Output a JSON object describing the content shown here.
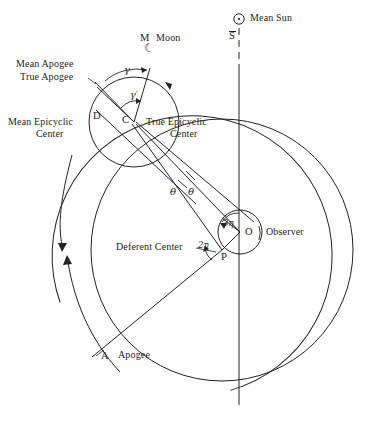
{
  "figure": {
    "stroke_color": "#232323",
    "background": "#ffffff"
  },
  "labels": {
    "mean_sun": "Mean Sun",
    "mean_sun_icon": "sun-symbol-circle-dot",
    "s_bar": "S",
    "moon_point": "M",
    "moon": "Moon",
    "moon_icon": "crescent-moon-glyph",
    "mean_apogee": "Mean Apogee",
    "true_apogee": "True Apogee",
    "mean_epicyclic_center_l1": "Mean Epicyclic",
    "mean_epicyclic_center_l2": "Center",
    "true_epicyclic_center_l1": "True Epicyclic",
    "true_epicyclic_center_l2": "Center",
    "point_d": "D",
    "point_c": "C",
    "point_o": "O",
    "point_p": "P",
    "point_a": "A",
    "observer": "Observer",
    "deferent_center": "Deferent Center",
    "apogee": "Apogee",
    "gamma": "γ",
    "gamma_prime": "γ′",
    "theta_left": "θ",
    "theta_right": "θ",
    "three_eta": "3η",
    "two_eta": "2η"
  },
  "geometry": {
    "observer": {
      "x": 240,
      "y": 232,
      "label": "O"
    },
    "small_circle_radius": 22,
    "deferent_center": {
      "x": 222,
      "y": 250,
      "label": "P"
    },
    "epicycle_center": {
      "x": 134,
      "y": 122,
      "label": "C"
    },
    "epicycle_radius": 45,
    "mean_epicycle_center": {
      "x": 104,
      "y": 140,
      "label": "D"
    },
    "moon": {
      "x": 151,
      "y": 65,
      "label": "M"
    },
    "apogee": {
      "x": 92,
      "y": 356,
      "label": "A"
    },
    "deferent_radius": 131,
    "outer_circle_center": {
      "x": 222,
      "y": 250
    },
    "mean_sun_marker": {
      "x": 239,
      "y": 19
    }
  }
}
